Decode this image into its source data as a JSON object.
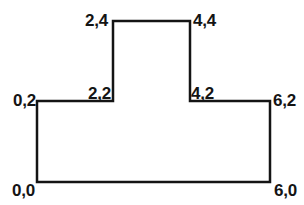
{
  "figure": {
    "background_color": "#ffffff",
    "stroke_color": "#141414",
    "stroke_width": 2.5,
    "shape_name": "t-shape-polygon",
    "coordinate_format": "x,y",
    "vertex_labels": [
      {
        "id": "v-0-0",
        "text": "0,0"
      },
      {
        "id": "v-0-2",
        "text": "0,2"
      },
      {
        "id": "v-2-2",
        "text": "2,2"
      },
      {
        "id": "v-2-4",
        "text": "2,4"
      },
      {
        "id": "v-4-4",
        "text": "4,4"
      },
      {
        "id": "v-4-2",
        "text": "4,2"
      },
      {
        "id": "v-6-2",
        "text": "6,2"
      },
      {
        "id": "v-6-0",
        "text": "6,0"
      }
    ],
    "path_points": "37,182 37,101 113,101 113,21 190,21 190,101 270,101 270,182"
  }
}
